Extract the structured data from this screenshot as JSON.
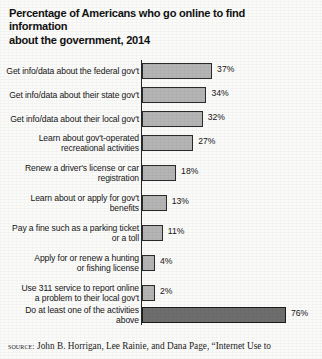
{
  "title": "Percentage of Americans who go online to find information\nabout the government, 2014",
  "source": {
    "label": "source:",
    "text": "John B. Horrigan, Lee Rainie, and Dana Page, “Internet Use to"
  },
  "colors": {
    "bar_fill": "#b5b5b5",
    "bar_emphasis_fill": "#6e6e6e",
    "bar_outline": "#2a2a2a",
    "axis": "#272727",
    "background": "#fbfbfa",
    "text": "#161616"
  },
  "chart_data": {
    "type": "bar",
    "orientation": "horizontal",
    "title": "Percentage of Americans who go online to find information about the government, 2014",
    "xlabel": "",
    "ylabel": "",
    "xlim": [
      0,
      80
    ],
    "grid": false,
    "legend": null,
    "value_suffix": "%",
    "categories": [
      "Get info/data about the federal gov't",
      "Get info/data about their state gov't",
      "Get info/data about their local gov't",
      "Learn about gov't-operated\nrecreational activities",
      "Renew a driver's license or car\nregistration",
      "Learn about or apply for gov't\nbenefits",
      "Pay a fine such as a parking ticket\nor a toll",
      "Apply for or renew a hunting\nor fishing license",
      "Use 311 service to report online\na problem to their local gov't",
      "Do at least one of the activities\nabove"
    ],
    "values": [
      37,
      34,
      32,
      27,
      18,
      13,
      11,
      4,
      2,
      76
    ],
    "value_labels": [
      "37%",
      "34%",
      "32%",
      "27%",
      "18%",
      "13%",
      "11%",
      "4%",
      "2%",
      "76%"
    ],
    "emphasized_index": 9
  }
}
